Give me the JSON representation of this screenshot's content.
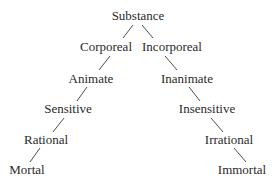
{
  "diagram": {
    "nodes": {
      "substance": {
        "label": "Substance",
        "x": 138,
        "y": 9
      },
      "corporeal": {
        "label": "Corporeal",
        "x": 106,
        "y": 40
      },
      "incorporeal": {
        "label": "Incorporeal",
        "x": 172,
        "y": 40
      },
      "animate": {
        "label": "Animate",
        "x": 91,
        "y": 72
      },
      "inanimate": {
        "label": "Inanimate",
        "x": 187,
        "y": 72
      },
      "sensitive": {
        "label": "Sensitive",
        "x": 68,
        "y": 102
      },
      "insensitive": {
        "label": "Insensitive",
        "x": 207,
        "y": 102
      },
      "rational": {
        "label": "Rational",
        "x": 46,
        "y": 133
      },
      "irrational": {
        "label": "Irrational",
        "x": 229,
        "y": 133
      },
      "mortal": {
        "label": "Mortal",
        "x": 27,
        "y": 163
      },
      "immortal": {
        "label": "Immortal",
        "x": 242,
        "y": 163
      }
    },
    "edges": [
      {
        "from": "substance",
        "to": "corporeal",
        "x1": 133,
        "y1": 25,
        "x2": 123,
        "y2": 38
      },
      {
        "from": "substance",
        "to": "incorporeal",
        "x1": 142,
        "y1": 25,
        "x2": 153,
        "y2": 38
      },
      {
        "from": "corporeal",
        "to": "animate",
        "x1": 110,
        "y1": 56,
        "x2": 99,
        "y2": 70
      },
      {
        "from": "incorporeal",
        "to": "inanimate",
        "x1": 165,
        "y1": 56,
        "x2": 177,
        "y2": 70
      },
      {
        "from": "animate",
        "to": "sensitive",
        "x1": 87,
        "y1": 87,
        "x2": 77,
        "y2": 101
      },
      {
        "from": "inanimate",
        "to": "insensitive",
        "x1": 189,
        "y1": 87,
        "x2": 200,
        "y2": 101
      },
      {
        "from": "sensitive",
        "to": "rational",
        "x1": 64,
        "y1": 118,
        "x2": 53,
        "y2": 132
      },
      {
        "from": "insensitive",
        "to": "irrational",
        "x1": 211,
        "y1": 118,
        "x2": 223,
        "y2": 132
      },
      {
        "from": "rational",
        "to": "mortal",
        "x1": 40,
        "y1": 148,
        "x2": 30,
        "y2": 162
      },
      {
        "from": "irrational",
        "to": "immortal",
        "x1": 234,
        "y1": 148,
        "x2": 246,
        "y2": 162
      }
    ]
  }
}
